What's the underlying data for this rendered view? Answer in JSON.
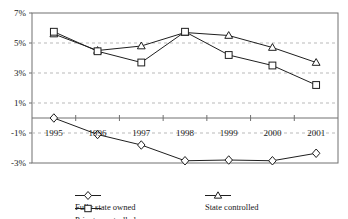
{
  "chart_data": {
    "type": "line",
    "title": "",
    "xlabel": "",
    "ylabel": "",
    "categories": [
      "1995",
      "1996",
      "1997",
      "1998",
      "1999",
      "2000",
      "2001"
    ],
    "ylim": [
      -3,
      7
    ],
    "ytick_labels": [
      "7%",
      "5%",
      "3%",
      "1%",
      "-1%",
      "-3%"
    ],
    "ytick_values": [
      7,
      5,
      3,
      1,
      -1,
      -3
    ],
    "grid": true,
    "grid_axis": "y",
    "legend_position": "bottom",
    "series": [
      {
        "name": "Fully state owned",
        "marker": "diamond",
        "values": [
          0.0,
          -1.1,
          -1.8,
          -2.85,
          -2.8,
          -2.85,
          -2.35
        ]
      },
      {
        "name": "State controlled",
        "marker": "triangle",
        "values": [
          5.6,
          4.5,
          4.8,
          5.7,
          5.5,
          4.7,
          3.7
        ]
      },
      {
        "name": "Private controlled",
        "marker": "square",
        "values": [
          5.75,
          4.45,
          3.7,
          5.75,
          4.2,
          3.5,
          2.2
        ]
      }
    ]
  },
  "legend": {
    "items": [
      {
        "label": "Fully state owned",
        "marker": "diamond"
      },
      {
        "label": "State controlled",
        "marker": "triangle"
      },
      {
        "label": "Private controlled",
        "marker": "square"
      }
    ]
  },
  "colors": {
    "line": "#1f1f1f",
    "grid": "#b9b9b9",
    "axis": "#707070",
    "marker_fill": "#ffffff",
    "background": "#ffffff"
  }
}
